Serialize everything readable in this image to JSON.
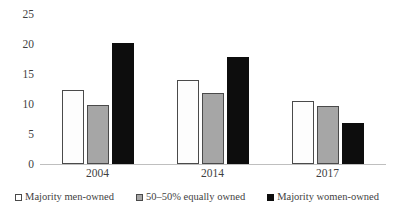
{
  "chart_data": {
    "type": "bar",
    "title": "",
    "subtitle": "",
    "xlabel": "",
    "ylabel": "",
    "categories": [
      "2004",
      "2014",
      "2017"
    ],
    "series": [
      {
        "name": "Majority men-owned",
        "values": [
          12.4,
          14.0,
          10.5
        ],
        "color": "#ffffff"
      },
      {
        "name": "50–50% equally owned",
        "values": [
          9.8,
          11.8,
          9.6
        ],
        "color": "#a6a6a6"
      },
      {
        "name": "Majority women-owned",
        "values": [
          20.2,
          17.8,
          6.8
        ],
        "color": "#0d0d0d"
      }
    ],
    "ylim": [
      0,
      25
    ],
    "yticks": [
      "0",
      "5",
      "10",
      "15",
      "20",
      "25"
    ],
    "grid": false,
    "legend_position": "bottom"
  },
  "legend": {
    "items": [
      {
        "label": "Majority men-owned",
        "swatch": "white-square-icon"
      },
      {
        "label": "50–50% equally owned",
        "swatch": "gray-square-icon"
      },
      {
        "label": "Majority women-owned",
        "swatch": "black-square-icon"
      }
    ]
  }
}
